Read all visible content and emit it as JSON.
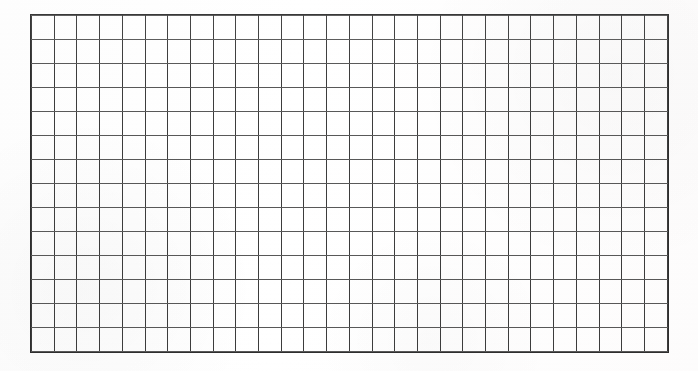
{
  "document": {
    "kind": "scanned-ruled-grid-sheet",
    "title": "",
    "content_text": "",
    "is_blank": true
  },
  "chart_data": {
    "type": "table",
    "title": "",
    "xlabel": "",
    "ylabel": "",
    "columns": 28,
    "rows": 14,
    "column_headers": [],
    "row_headers": [],
    "cells": [
      [
        "",
        "",
        "",
        "",
        "",
        "",
        "",
        "",
        "",
        "",
        "",
        "",
        "",
        "",
        "",
        "",
        "",
        "",
        "",
        "",
        "",
        "",
        "",
        "",
        "",
        "",
        "",
        ""
      ],
      [
        "",
        "",
        "",
        "",
        "",
        "",
        "",
        "",
        "",
        "",
        "",
        "",
        "",
        "",
        "",
        "",
        "",
        "",
        "",
        "",
        "",
        "",
        "",
        "",
        "",
        "",
        "",
        ""
      ],
      [
        "",
        "",
        "",
        "",
        "",
        "",
        "",
        "",
        "",
        "",
        "",
        "",
        "",
        "",
        "",
        "",
        "",
        "",
        "",
        "",
        "",
        "",
        "",
        "",
        "",
        "",
        "",
        ""
      ],
      [
        "",
        "",
        "",
        "",
        "",
        "",
        "",
        "",
        "",
        "",
        "",
        "",
        "",
        "",
        "",
        "",
        "",
        "",
        "",
        "",
        "",
        "",
        "",
        "",
        "",
        "",
        "",
        ""
      ],
      [
        "",
        "",
        "",
        "",
        "",
        "",
        "",
        "",
        "",
        "",
        "",
        "",
        "",
        "",
        "",
        "",
        "",
        "",
        "",
        "",
        "",
        "",
        "",
        "",
        "",
        "",
        "",
        ""
      ],
      [
        "",
        "",
        "",
        "",
        "",
        "",
        "",
        "",
        "",
        "",
        "",
        "",
        "",
        "",
        "",
        "",
        "",
        "",
        "",
        "",
        "",
        "",
        "",
        "",
        "",
        "",
        "",
        ""
      ],
      [
        "",
        "",
        "",
        "",
        "",
        "",
        "",
        "",
        "",
        "",
        "",
        "",
        "",
        "",
        "",
        "",
        "",
        "",
        "",
        "",
        "",
        "",
        "",
        "",
        "",
        "",
        "",
        ""
      ],
      [
        "",
        "",
        "",
        "",
        "",
        "",
        "",
        "",
        "",
        "",
        "",
        "",
        "",
        "",
        "",
        "",
        "",
        "",
        "",
        "",
        "",
        "",
        "",
        "",
        "",
        "",
        "",
        ""
      ],
      [
        "",
        "",
        "",
        "",
        "",
        "",
        "",
        "",
        "",
        "",
        "",
        "",
        "",
        "",
        "",
        "",
        "",
        "",
        "",
        "",
        "",
        "",
        "",
        "",
        "",
        "",
        "",
        ""
      ],
      [
        "",
        "",
        "",
        "",
        "",
        "",
        "",
        "",
        "",
        "",
        "",
        "",
        "",
        "",
        "",
        "",
        "",
        "",
        "",
        "",
        "",
        "",
        "",
        "",
        "",
        "",
        "",
        ""
      ],
      [
        "",
        "",
        "",
        "",
        "",
        "",
        "",
        "",
        "",
        "",
        "",
        "",
        "",
        "",
        "",
        "",
        "",
        "",
        "",
        "",
        "",
        "",
        "",
        "",
        "",
        "",
        "",
        ""
      ],
      [
        "",
        "",
        "",
        "",
        "",
        "",
        "",
        "",
        "",
        "",
        "",
        "",
        "",
        "",
        "",
        "",
        "",
        "",
        "",
        "",
        "",
        "",
        "",
        "",
        "",
        "",
        "",
        ""
      ],
      [
        "",
        "",
        "",
        "",
        "",
        "",
        "",
        "",
        "",
        "",
        "",
        "",
        "",
        "",
        "",
        "",
        "",
        "",
        "",
        "",
        "",
        "",
        "",
        "",
        "",
        "",
        "",
        ""
      ],
      [
        "",
        "",
        "",
        "",
        "",
        "",
        "",
        "",
        "",
        "",
        "",
        "",
        "",
        "",
        "",
        "",
        "",
        "",
        "",
        "",
        "",
        "",
        "",
        "",
        "",
        "",
        "",
        ""
      ]
    ],
    "grid": true,
    "legend": [],
    "annotations": []
  },
  "colors": {
    "page_background": "#fefefe",
    "grid_line_vertical": "#3c3c3c",
    "grid_line_horizontal": "#585858",
    "grid_border": "#2e2e2e",
    "ink": "#202020"
  },
  "geometry": {
    "grid_left": 31,
    "grid_top": 15,
    "grid_width": 637,
    "grid_height": 337
  }
}
